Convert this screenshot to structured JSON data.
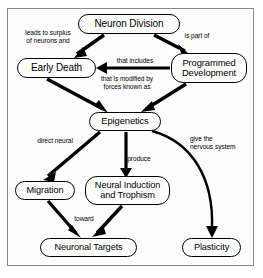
{
  "diagram": {
    "border_color": "#8a8a8a",
    "node_color": "#000000",
    "background": "#ffffff",
    "nodes": [
      {
        "id": "neuron-division",
        "label": "Neuron Division",
        "x": 78,
        "y": 14,
        "w": 102,
        "h": 20,
        "font": 10
      },
      {
        "id": "early-death",
        "label": "Early Death",
        "x": 17,
        "y": 58,
        "w": 79,
        "h": 20,
        "font": 10
      },
      {
        "id": "programmed-development",
        "label": "Programmed\nDevelopment",
        "x": 171,
        "y": 53,
        "w": 76,
        "h": 30,
        "font": 9.4
      },
      {
        "id": "epigenetics",
        "label": "Epigenetics",
        "x": 89,
        "y": 112,
        "w": 72,
        "h": 19,
        "font": 9.4
      },
      {
        "id": "migration",
        "label": "Migration",
        "x": 15,
        "y": 181,
        "w": 60,
        "h": 19,
        "font": 9.2
      },
      {
        "id": "neural-induction",
        "label": "Neural Induction\nand Trophism",
        "x": 85,
        "y": 176,
        "w": 85,
        "h": 29,
        "font": 9.2
      },
      {
        "id": "neuronal-targets",
        "label": "Neuronal Targets",
        "x": 40,
        "y": 238,
        "w": 97,
        "h": 19,
        "font": 9.2
      },
      {
        "id": "plasticity",
        "label": "Plasticity",
        "x": 182,
        "y": 238,
        "w": 59,
        "h": 19,
        "font": 9.2
      }
    ],
    "edge_labels": [
      {
        "id": "leads-to-surplus",
        "text": "leads to surplus\nof neurons and",
        "x": 14,
        "y": 29,
        "w": 68
      },
      {
        "id": "is-part-of",
        "text": "is part of",
        "x": 175,
        "y": 32,
        "w": 44
      },
      {
        "id": "that-includes",
        "text": "that includes",
        "x": 108,
        "y": 57,
        "w": 54
      },
      {
        "id": "that-is-modified-by",
        "text": "that is modified by\nforces known as",
        "x": 87,
        "y": 75,
        "w": 80
      },
      {
        "id": "direct-neural",
        "text": "direct neural",
        "x": 29,
        "y": 137,
        "w": 52
      },
      {
        "id": "produce",
        "text": "produce",
        "x": 121,
        "y": 155,
        "w": 36
      },
      {
        "id": "give-the-nervous-system",
        "text": "give the\nnervous system",
        "x": 190,
        "y": 135,
        "w": 64
      },
      {
        "id": "toward",
        "text": "toward",
        "x": 68,
        "y": 215,
        "w": 32
      }
    ],
    "edges": [
      {
        "id": "neuron-division-to-early-death",
        "from": "neuron-division",
        "to": "early-death"
      },
      {
        "id": "neuron-division-to-programmed-development",
        "from": "neuron-division",
        "to": "programmed-development"
      },
      {
        "id": "programmed-development-to-early-death",
        "from": "programmed-development",
        "to": "early-death"
      },
      {
        "id": "early-death-to-epigenetics",
        "from": "early-death",
        "to": "epigenetics"
      },
      {
        "id": "programmed-development-to-epigenetics",
        "from": "programmed-development",
        "to": "epigenetics"
      },
      {
        "id": "epigenetics-to-migration",
        "from": "epigenetics",
        "to": "migration"
      },
      {
        "id": "epigenetics-to-neural-induction",
        "from": "epigenetics",
        "to": "neural-induction"
      },
      {
        "id": "epigenetics-to-plasticity",
        "from": "epigenetics",
        "to": "plasticity"
      },
      {
        "id": "migration-to-neuronal-targets",
        "from": "migration",
        "to": "neuronal-targets"
      },
      {
        "id": "neural-induction-to-neuronal-targets",
        "from": "neural-induction",
        "to": "neuronal-targets"
      }
    ]
  }
}
